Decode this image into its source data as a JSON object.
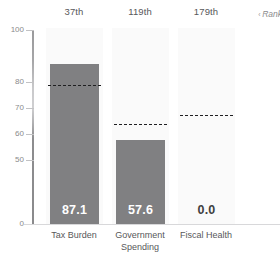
{
  "chart_data": {
    "type": "bar",
    "title": "",
    "xlabel": "",
    "ylabel": "",
    "categories": [
      "Tax Burden",
      "Government Spending",
      "Fiscal Health"
    ],
    "values": [
      87.1,
      57.6,
      0.0
    ],
    "value_labels": [
      "87.1",
      "57.6",
      "0.0"
    ],
    "ranks": [
      "37th",
      "119th",
      "179th"
    ],
    "reference_lines": [
      79.0,
      64.0,
      67.5
    ],
    "reference_line_style": "dashed",
    "ylim": [
      0,
      100
    ],
    "ytick_labels": [
      "100",
      "80",
      "70",
      "60",
      "50",
      "0"
    ],
    "ytick_values": [
      100,
      80,
      70,
      60,
      50,
      0
    ],
    "grid": false,
    "legend": "none",
    "bar_color": "#808082",
    "reference_line_color": "#1f1f21",
    "band_color": "#fafafa",
    "axis_color": "#9a9a9c",
    "value_label_color": "#ffffff",
    "zero_value_label_color": "#3f3f41"
  },
  "header": {
    "rank_note": "Rank",
    "rank_caret": "‹"
  }
}
